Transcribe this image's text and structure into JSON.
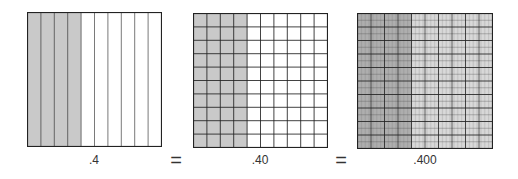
{
  "diagram": {
    "colors": {
      "shade": "#c9c9c9",
      "shade_dark_grid": "#b5b5b5",
      "line": "#222222",
      "thin_line": "#555555",
      "background": "#ffffff"
    },
    "panels": [
      {
        "id": "tenths",
        "label": ".4",
        "columns": 10,
        "rows": 1,
        "sub_columns": 1,
        "sub_rows": 1,
        "shaded_columns": 4
      },
      {
        "id": "hundredths",
        "label": ".40",
        "columns": 10,
        "rows": 10,
        "sub_columns": 1,
        "sub_rows": 1,
        "shaded_columns": 4
      },
      {
        "id": "thousandths",
        "label": ".400",
        "columns": 10,
        "rows": 10,
        "sub_columns": 10,
        "sub_rows": 2,
        "shaded_columns": 4
      }
    ],
    "operators": [
      "=",
      "="
    ]
  }
}
